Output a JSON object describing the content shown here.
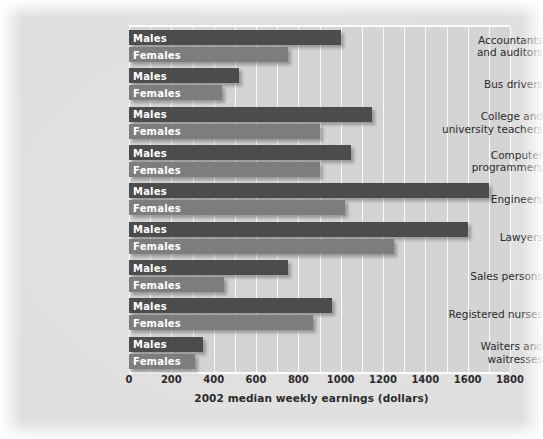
{
  "chart_data": {
    "type": "bar",
    "orientation": "horizontal",
    "title": "",
    "xlabel": "2002 median weekly earnings (dollars)",
    "ylabel": "",
    "xlim": [
      0,
      1800
    ],
    "xticks": [
      0,
      200,
      400,
      600,
      800,
      1000,
      1200,
      1400,
      1600,
      1800
    ],
    "grid": true,
    "legend": "inline-bar-labels",
    "series_labels": {
      "male": "Males",
      "female": "Females"
    },
    "colors": {
      "male": "#4c4c4c",
      "female": "#7d7d7d",
      "plot_bg": "#d4d4d4",
      "grid": "#fafafa",
      "page_bg": "#e2e2e2",
      "text": "#2b2b2b",
      "bar_text": "#ffffff"
    },
    "categories": [
      "Accountants\nand auditors",
      "Bus drivers",
      "College and\nuniversity teachers",
      "Computer\nprogrammers",
      "Engineers",
      "Lawyers",
      "Sales persons",
      "Registered nurses",
      "Waiters and\nwaitresses"
    ],
    "series": [
      {
        "name": "Males",
        "values": [
          1000,
          520,
          1150,
          1050,
          1700,
          1600,
          750,
          960,
          350
        ]
      },
      {
        "name": "Females",
        "values": [
          750,
          440,
          900,
          900,
          1020,
          1250,
          450,
          870,
          310
        ]
      }
    ]
  }
}
